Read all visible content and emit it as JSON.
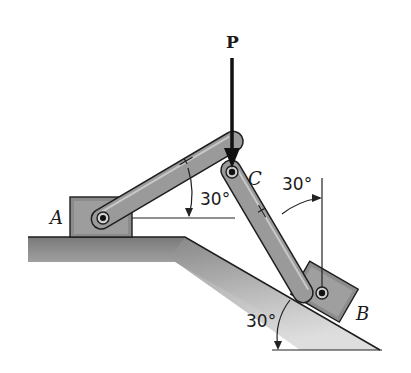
{
  "labels": {
    "force": "P",
    "pin_c": "C",
    "block_a": "A",
    "block_b": "B"
  },
  "angles": {
    "member_ac_from_horizontal": "30°",
    "member_cb_from_vertical": "30°",
    "incline_from_horizontal": "30°"
  },
  "colors": {
    "member_fill": "#9a9a9a",
    "member_stroke": "#1e1e1e",
    "block_fill": "#8c8c8c",
    "ground_fill": "#a8a8a8",
    "line": "#222222"
  }
}
